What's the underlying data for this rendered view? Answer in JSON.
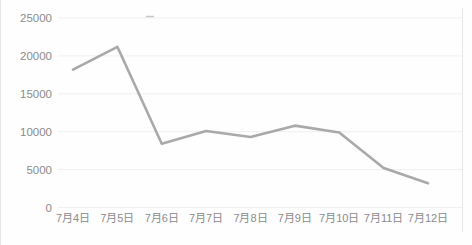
{
  "chart": {
    "line_color": "#a9a9a9",
    "gridline_color": "#efefef",
    "axis_text_color": "#8a8a8a",
    "background_color": "#fefefe",
    "faint_border_color": "#e6e6e6",
    "artifact_dash_color": "#9a9a9a"
  },
  "chart_data": {
    "type": "line",
    "categories": [
      "7月4日",
      "7月5日",
      "7月6日",
      "7月7日",
      "7月8日",
      "7月9日",
      "7月10日",
      "7月11日",
      "7月12日"
    ],
    "values": [
      18200,
      21200,
      8400,
      10100,
      9300,
      10800,
      9900,
      5200,
      3200
    ],
    "series": [
      {
        "name": "",
        "values": [
          18200,
          21200,
          8400,
          10100,
          9300,
          10800,
          9900,
          5200,
          3200
        ]
      }
    ],
    "title": "",
    "xlabel": "",
    "ylabel": "",
    "ylim": [
      0,
      25000
    ],
    "yticks": [
      0,
      5000,
      10000,
      15000,
      20000,
      25000
    ],
    "ytick_labels": [
      "0",
      "5000",
      "10000",
      "15000",
      "20000",
      "25000"
    ],
    "grid": true,
    "legend_position": "none",
    "markers": false
  }
}
